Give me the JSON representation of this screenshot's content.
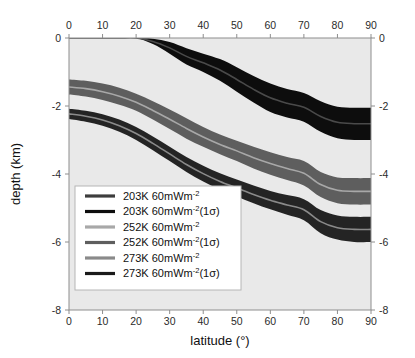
{
  "chart_data": {
    "type": "area",
    "title": "",
    "xlabel": "latitude (°)",
    "ylabel": "depth (km)",
    "xlim": [
      0,
      90
    ],
    "ylim": [
      -8,
      0
    ],
    "xticks": [
      0,
      10,
      20,
      30,
      40,
      50,
      60,
      70,
      80,
      90
    ],
    "yticks": [
      0,
      -2,
      -4,
      -6,
      -8
    ],
    "xtick_labels": [
      "0",
      "10",
      "20",
      "30",
      "40",
      "50",
      "60",
      "70",
      "80",
      "90"
    ],
    "ytick_labels": [
      "0",
      "-2",
      "-4",
      "-6",
      "-8"
    ],
    "grid": false,
    "legend_position": "lower-left",
    "axes": {
      "top_axis": true,
      "bottom_axis": true,
      "left_axis": true,
      "right_axis": true,
      "top_tick_labels": [
        "0",
        "10",
        "20",
        "30",
        "40",
        "50",
        "60",
        "70",
        "80",
        "90"
      ],
      "bottom_tick_labels": [
        "0",
        "10",
        "20",
        "30",
        "40",
        "50",
        "60",
        "70",
        "80",
        "90"
      ],
      "left_tick_labels": [
        "0",
        "-2",
        "-4",
        "-6",
        "-8"
      ],
      "right_tick_labels": [
        "0",
        "-2",
        "-4",
        "-6",
        "-8"
      ]
    },
    "plot_background": "#e9e9e9",
    "x": [
      0,
      5,
      10,
      15,
      20,
      25,
      30,
      35,
      40,
      45,
      50,
      55,
      60,
      65,
      70,
      75,
      80,
      85,
      90
    ],
    "series": [
      {
        "name": "203K 60mWm-2 (1 sigma) band",
        "label": "203K 60mWm⁻²(1σ)",
        "color": "#0d0d0d",
        "kind": "band",
        "upper": [
          0,
          0,
          0,
          0,
          0,
          -0.02,
          -0.12,
          -0.3,
          -0.46,
          -0.62,
          -0.86,
          -1.12,
          -1.34,
          -1.5,
          -1.62,
          -1.86,
          -2.02,
          -2.05,
          -2.05
        ],
        "lower": [
          0,
          0,
          0,
          0,
          0,
          -0.18,
          -0.46,
          -0.78,
          -1.0,
          -1.26,
          -1.58,
          -1.9,
          -2.18,
          -2.34,
          -2.46,
          -2.76,
          -2.95,
          -3.0,
          -3.0
        ]
      },
      {
        "name": "203K 60mWm-2 central line",
        "label": "203K 60mWm⁻²",
        "color": "#4a4a4a",
        "kind": "line",
        "values": [
          0,
          0,
          0,
          0,
          0,
          -0.1,
          -0.29,
          -0.54,
          -0.73,
          -0.94,
          -1.22,
          -1.51,
          -1.76,
          -1.92,
          -2.04,
          -2.31,
          -2.48,
          -2.52,
          -2.52
        ]
      },
      {
        "name": "252K 60mWm-2 (1 sigma) band",
        "label": "252K 60mWm⁻²(1σ)",
        "color": "#5e5e5e",
        "kind": "band",
        "upper": [
          -1.22,
          -1.26,
          -1.34,
          -1.46,
          -1.64,
          -1.86,
          -2.1,
          -2.36,
          -2.62,
          -2.84,
          -3.02,
          -3.2,
          -3.36,
          -3.5,
          -3.62,
          -3.94,
          -4.1,
          -4.12,
          -4.12
        ],
        "lower": [
          -1.66,
          -1.72,
          -1.82,
          -1.96,
          -2.14,
          -2.4,
          -2.68,
          -2.96,
          -3.2,
          -3.42,
          -3.62,
          -3.84,
          -4.02,
          -4.18,
          -4.34,
          -4.68,
          -4.86,
          -4.9,
          -4.9
        ]
      },
      {
        "name": "252K 60mWm-2 central line",
        "label": "252K 60mWm⁻²",
        "color": "#a8a8a8",
        "kind": "line",
        "values": [
          -1.44,
          -1.49,
          -1.58,
          -1.71,
          -1.89,
          -2.13,
          -2.39,
          -2.66,
          -2.91,
          -3.13,
          -3.32,
          -3.52,
          -3.69,
          -3.84,
          -3.98,
          -4.31,
          -4.48,
          -4.51,
          -4.51
        ]
      },
      {
        "name": "273K 60mWm-2 (1 sigma) band",
        "label": "273K 60mWm⁻²(1σ)",
        "color": "#242424",
        "kind": "band",
        "upper": [
          -2.08,
          -2.14,
          -2.24,
          -2.4,
          -2.62,
          -2.9,
          -3.2,
          -3.5,
          -3.76,
          -3.98,
          -4.16,
          -4.34,
          -4.5,
          -4.62,
          -4.74,
          -5.06,
          -5.22,
          -5.26,
          -5.26
        ],
        "lower": [
          -2.38,
          -2.46,
          -2.58,
          -2.76,
          -3.0,
          -3.3,
          -3.62,
          -3.94,
          -4.22,
          -4.46,
          -4.66,
          -4.86,
          -5.04,
          -5.2,
          -5.36,
          -5.74,
          -5.93,
          -6.0,
          -6.0
        ]
      },
      {
        "name": "273K 60mWm-2 central line",
        "label": "273K 60mWm⁻²",
        "color": "#8a8a8a",
        "kind": "line",
        "values": [
          -2.23,
          -2.3,
          -2.41,
          -2.58,
          -2.81,
          -3.1,
          -3.41,
          -3.72,
          -3.99,
          -4.22,
          -4.41,
          -4.6,
          -4.77,
          -4.91,
          -5.05,
          -5.4,
          -5.58,
          -5.63,
          -5.63
        ]
      }
    ],
    "legend": {
      "entries": [
        {
          "label_plain": "203K 60mWm",
          "exponent": "-2",
          "suffix": "",
          "swatch_color": "#3d3d3d"
        },
        {
          "label_plain": "203K 60mWm",
          "exponent": "-2",
          "suffix": "(1σ)",
          "swatch_color": "#0d0d0d"
        },
        {
          "label_plain": "252K 60mWm",
          "exponent": "-2",
          "suffix": "",
          "swatch_color": "#a8a8a8"
        },
        {
          "label_plain": "252K 60mWm",
          "exponent": "-2",
          "suffix": "(1σ)",
          "swatch_color": "#5e5e5e"
        },
        {
          "label_plain": "273K 60mWm",
          "exponent": "-2",
          "suffix": "",
          "swatch_color": "#8a8a8a"
        },
        {
          "label_plain": "273K 60mWm",
          "exponent": "-2",
          "suffix": "(1σ)",
          "swatch_color": "#1a1a1a"
        }
      ]
    }
  }
}
